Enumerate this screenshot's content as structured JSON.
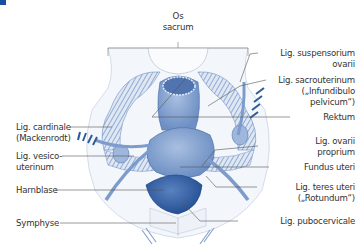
{
  "diagram": {
    "corner_marker_color": "#1a4fa0",
    "accent_color": "#7d9ccb",
    "dark_accent_color": "#2d5a99",
    "labels": {
      "os_sacrum": [
        "Os",
        "sacrum"
      ],
      "lig_suspensorium": [
        "Lig. suspensorium",
        "ovarii"
      ],
      "lig_sacrouterinum": [
        "Lig. sacrouterinum",
        "(„Infundibulo",
        "pelvicum“)"
      ],
      "rektum": "Rektum",
      "lig_ovarii": [
        "Lig. ovarii",
        "proprium"
      ],
      "fundus_uteri": "Fundus uteri",
      "lig_teres": [
        "Lig. teres uteri",
        "(„Rotundum“)"
      ],
      "lig_pubocervicale": "Lig. pubocervicale",
      "lig_cardinale": [
        "Lig. cardinale",
        "(Mackenrodt)"
      ],
      "lig_vesico": [
        "Lig. vesico-",
        "uterinum"
      ],
      "harnblase": "Harnblase",
      "symphyse": "Symphyse"
    }
  }
}
